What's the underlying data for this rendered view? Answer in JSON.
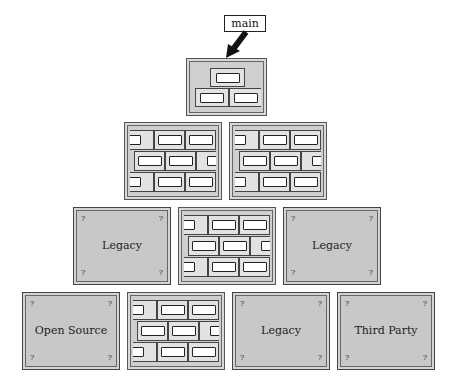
{
  "diagram": {
    "entry_label": "main",
    "arrow": {
      "from": "main-label",
      "to": "main-module",
      "icon": "thick-arrow-icon"
    },
    "top_module": {
      "type": "brick-wall",
      "rows": 2
    },
    "rows": [
      {
        "modules": [
          {
            "type": "brick-wall",
            "title": ""
          },
          {
            "type": "brick-wall",
            "title": ""
          }
        ]
      },
      {
        "modules": [
          {
            "type": "opaque",
            "title": "Legacy"
          },
          {
            "type": "brick-wall",
            "title": ""
          },
          {
            "type": "opaque",
            "title": "Legacy"
          }
        ]
      },
      {
        "modules": [
          {
            "type": "opaque",
            "title": "Open Source"
          },
          {
            "type": "brick-wall",
            "title": ""
          },
          {
            "type": "opaque",
            "title": "Legacy"
          },
          {
            "type": "opaque",
            "title": "Third Party"
          }
        ]
      }
    ],
    "unknown_marker": "?",
    "colors": {
      "module_fill": "#c8c8c8",
      "brick_fill": "#e2e2e2",
      "stroke": "#444444"
    }
  }
}
